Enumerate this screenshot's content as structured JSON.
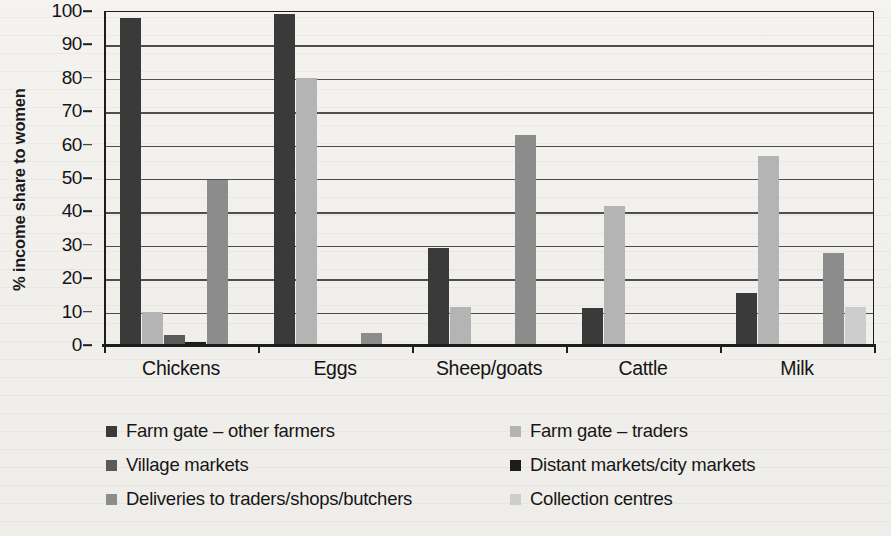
{
  "chart_data": {
    "type": "bar",
    "title": "",
    "subtitle": "",
    "xlabel": "",
    "ylabel": "% income share to women",
    "ylim": [
      0,
      100
    ],
    "ytick_step": 10,
    "yticks": [
      0,
      10,
      20,
      30,
      40,
      50,
      60,
      70,
      80,
      90,
      100
    ],
    "grid": true,
    "grid_axis": "y",
    "legend_position": "bottom",
    "legend_columns": 2,
    "categories": [
      "Chickens",
      "Eggs",
      "Sheep/goats",
      "Cattle",
      "Milk"
    ],
    "series": [
      {
        "name": "Farm gate – other farmers",
        "color": "#3a3a3a",
        "values": [
          98,
          99,
          29,
          11,
          15.5
        ]
      },
      {
        "name": "Farm gate – traders",
        "color": "#b4b4b4",
        "values": [
          10,
          80,
          11.5,
          41.5,
          56.5
        ]
      },
      {
        "name": "Village markets",
        "color": "#5a5a5a",
        "values": [
          3,
          null,
          null,
          null,
          null
        ]
      },
      {
        "name": "Distant markets/city markets",
        "color": "#1c1c1c",
        "values": [
          1,
          null,
          null,
          null,
          null
        ]
      },
      {
        "name": "Deliveries to traders/shops/butchers",
        "color": "#8c8c8c",
        "values": [
          49.5,
          3.5,
          63,
          null,
          27.5
        ]
      },
      {
        "name": "Collection centres",
        "color": "#cdcdcd",
        "values": [
          null,
          null,
          null,
          null,
          11.5
        ]
      }
    ]
  }
}
